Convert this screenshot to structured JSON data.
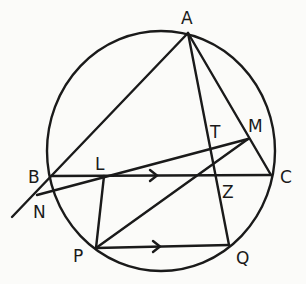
{
  "diagram": {
    "type": "geometry-circle-construction",
    "circle": {
      "cx": 161,
      "cy": 151,
      "rx": 114,
      "ry": 120
    },
    "points": {
      "A": {
        "label": "A",
        "x": 188,
        "y": 33
      },
      "B": {
        "label": "B",
        "x": 51,
        "y": 176
      },
      "C": {
        "label": "C",
        "x": 271,
        "y": 175
      },
      "L": {
        "label": "L",
        "x": 104,
        "y": 176
      },
      "M": {
        "label": "M",
        "x": 248,
        "y": 139
      },
      "N": {
        "label": "N",
        "x": 37,
        "y": 195
      },
      "P": {
        "label": "P",
        "x": 96,
        "y": 248
      },
      "Q": {
        "label": "Q",
        "x": 229,
        "y": 245
      },
      "T": {
        "label": "T",
        "x": 214,
        "y": 159
      },
      "Z": {
        "label": "Z",
        "x": 217,
        "y": 175
      }
    },
    "segments": [
      {
        "from": "A",
        "to": "extension-below-B",
        "note": "line AB extended past B"
      },
      {
        "from": "A",
        "to": "Q",
        "note": "passes through T and Z"
      },
      {
        "from": "A",
        "to": "C",
        "note": "passes through M"
      },
      {
        "from": "B",
        "to": "C",
        "note": "with arrow marker indicating direction"
      },
      {
        "from": "M",
        "to": "N",
        "note": "passes through L"
      },
      {
        "from": "M",
        "to": "P"
      },
      {
        "from": "L",
        "to": "P"
      },
      {
        "from": "P",
        "to": "Q",
        "note": "with arrow marker; parallel to BC"
      }
    ],
    "parallel_marks": [
      "BC",
      "PQ"
    ]
  }
}
